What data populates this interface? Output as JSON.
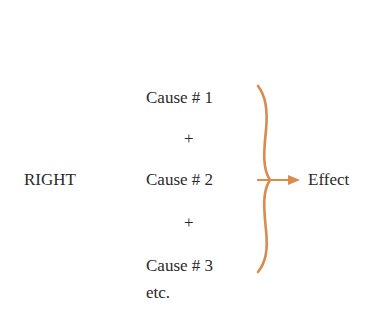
{
  "diagram": {
    "label": "RIGHT",
    "causes": [
      "Cause # 1",
      "Cause # 2",
      "Cause # 3"
    ],
    "operator": "+",
    "continuation": "etc.",
    "effect": "Effect",
    "colors": {
      "brace": "#d98b4a",
      "arrow": "#d98b4a",
      "text": "#2a2a2a"
    }
  }
}
